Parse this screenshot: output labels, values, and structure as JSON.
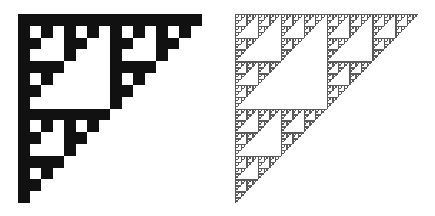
{
  "background_color": "#ffffff",
  "figures": [
    {
      "name": "sierpinski-triangle-coarse",
      "type": "sierpinski-right-triangle",
      "grid_size": 16,
      "fill_color": "#111111",
      "rule": "cell filled when (row AND col) == 0"
    },
    {
      "name": "sierpinski-triangle-fine",
      "type": "sierpinski-right-triangle",
      "grid_size": 128,
      "fill_color": "#5a5a5a",
      "rule": "cell filled when (row AND col) == 0"
    }
  ]
}
